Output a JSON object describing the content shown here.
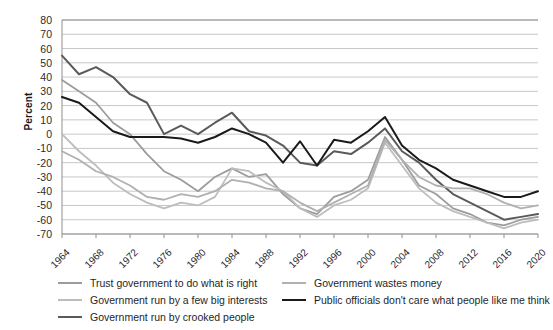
{
  "chart_data": {
    "type": "line",
    "title": "",
    "xlabel": "",
    "ylabel": "Percent",
    "grid": true,
    "legend_position": "bottom",
    "ylim": [
      -70,
      80
    ],
    "yticks": [
      80,
      70,
      60,
      50,
      40,
      30,
      20,
      10,
      0,
      -10,
      -20,
      -30,
      -40,
      -50,
      -60,
      -70
    ],
    "x": [
      1964,
      1966,
      1968,
      1970,
      1972,
      1974,
      1976,
      1978,
      1980,
      1982,
      1984,
      1986,
      1988,
      1990,
      1992,
      1994,
      1996,
      1998,
      2000,
      2002,
      2004,
      2006,
      2008,
      2010,
      2012,
      2014,
      2016,
      2018,
      2020
    ],
    "xticks": [
      "1964",
      "1968",
      "1972",
      "1976",
      "1980",
      "1984",
      "1988",
      "1992",
      "1996",
      "2000",
      "2004",
      "2008",
      "2012",
      "2016",
      "2020"
    ],
    "series": [
      {
        "name": "Trust government to do what is right",
        "color": "#9c9c9c",
        "width": 1.8,
        "values": [
          38,
          30,
          22,
          8,
          0,
          -14,
          -26,
          -32,
          -40,
          -30,
          -24,
          -30,
          -28,
          -42,
          -52,
          -56,
          -44,
          -40,
          -32,
          -2,
          -18,
          -36,
          -42,
          -52,
          -56,
          -62,
          -64,
          -60,
          -58
        ]
      },
      {
        "name": "Government run by a few big interests",
        "color": "#bdbdbd",
        "width": 1.8,
        "values": [
          0,
          -12,
          -22,
          -34,
          -42,
          -48,
          -52,
          -48,
          -50,
          -44,
          -24,
          -26,
          -34,
          -40,
          -52,
          -58,
          -50,
          -46,
          -38,
          -6,
          -22,
          -38,
          -48,
          -54,
          -58,
          -62,
          -66,
          -62,
          -60
        ]
      },
      {
        "name": "Government run by crooked people",
        "color": "#5a5a5a",
        "width": 2.0,
        "values": [
          55,
          42,
          47,
          40,
          28,
          22,
          0,
          6,
          0,
          8,
          15,
          2,
          -1,
          -8,
          -20,
          -22,
          -12,
          -14,
          -6,
          4,
          -12,
          -20,
          -32,
          -42,
          -48,
          -54,
          -60,
          -58,
          -56
        ]
      },
      {
        "name": "Government wastes money",
        "color": "#b0b0b0",
        "width": 1.8,
        "values": [
          -12,
          -18,
          -26,
          -30,
          -36,
          -44,
          -46,
          -42,
          -44,
          -40,
          -32,
          -34,
          -38,
          -40,
          -48,
          -54,
          -48,
          -42,
          -36,
          -4,
          -18,
          -30,
          -36,
          -38,
          -38,
          -42,
          -48,
          -52,
          -50
        ]
      },
      {
        "name": "Public officials don't care what people like me think",
        "color": "#1a1a1a",
        "width": 2.0,
        "values": [
          26,
          22,
          12,
          2,
          -2,
          -2,
          -2,
          -3,
          -6,
          -2,
          4,
          0,
          -6,
          -20,
          -5,
          -22,
          -4,
          -6,
          2,
          12,
          -8,
          -18,
          -24,
          -32,
          -36,
          -40,
          -44,
          -44,
          -40
        ]
      }
    ]
  },
  "axis": {
    "ylabel": "Percent"
  },
  "legend": {
    "items": [
      {
        "label": "Trust government to do what is right",
        "color": "#9c9c9c",
        "width": 2
      },
      {
        "label": "Government run by a few big interests",
        "color": "#bdbdbd",
        "width": 2
      },
      {
        "label": "Government run by crooked people",
        "color": "#5a5a5a",
        "width": 2.5
      },
      {
        "label": "Government wastes money",
        "color": "#b0b0b0",
        "width": 2
      },
      {
        "label": "Public officials don't care what people like me think",
        "color": "#1a1a1a",
        "width": 2.5
      }
    ]
  }
}
